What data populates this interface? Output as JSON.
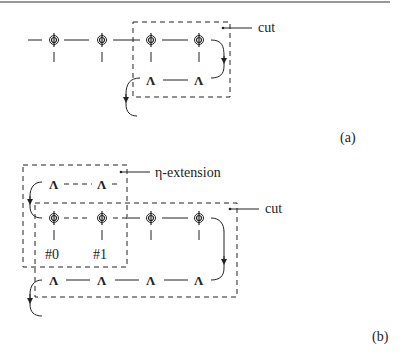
{
  "figure": {
    "panels": [
      {
        "id": "a",
        "label": "(a)",
        "cut_label": "cut",
        "phi_nodes": 4,
        "lambda_nodes": 2,
        "node_symbol_phi": "ϕ",
        "node_symbol_lambda": "Λ"
      },
      {
        "id": "b",
        "label": "(b)",
        "cut_label": "cut",
        "extension_label": "η-extension",
        "phi_nodes": 4,
        "lambda_top_nodes": 2,
        "lambda_bottom_nodes": 4,
        "node_symbol_phi": "ϕ",
        "node_symbol_lambda": "Λ",
        "index_labels": [
          "#0",
          "#1"
        ]
      }
    ]
  }
}
